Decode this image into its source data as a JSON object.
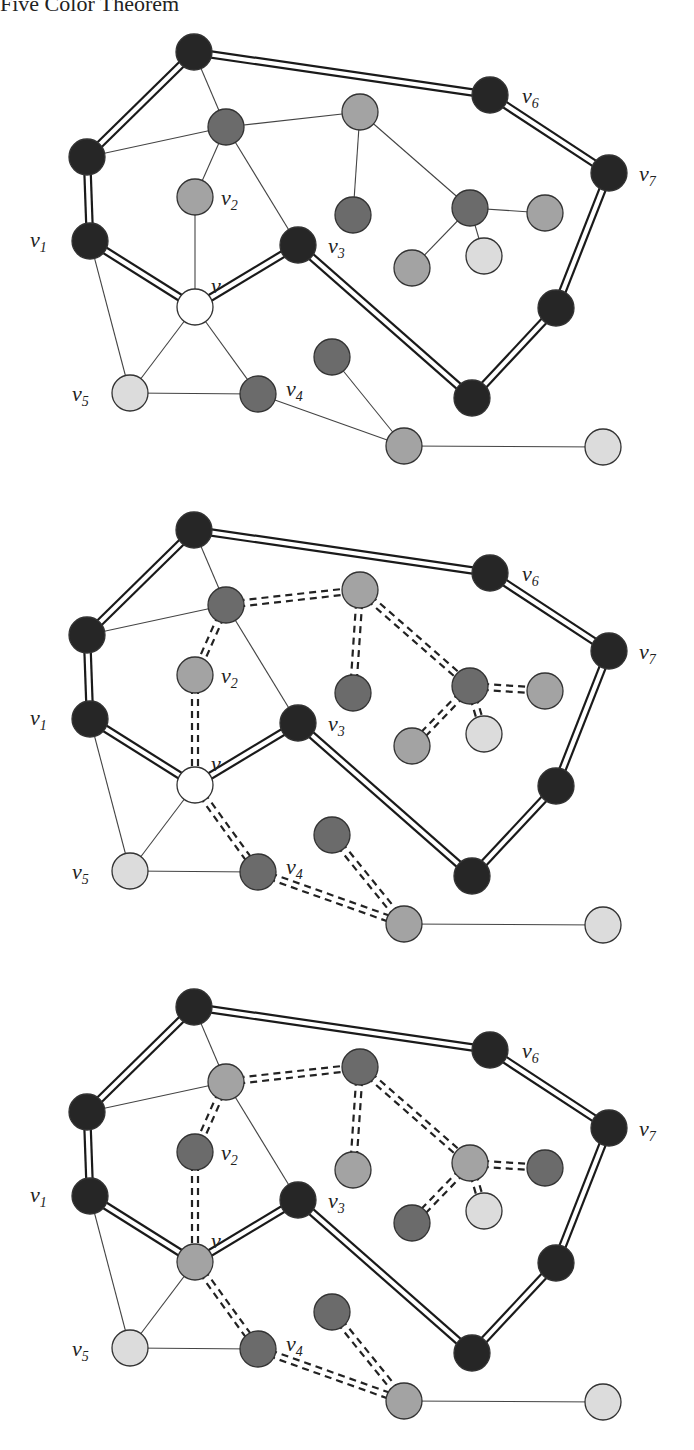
{
  "header": {
    "title": "Five Color Theorem"
  },
  "colors": {
    "black": "#262626",
    "dark": "#6b6b6b",
    "mid": "#a3a3a3",
    "pale": "#dcdcdc",
    "white": "#ffffff",
    "stroke": "#333333"
  },
  "labels": {
    "v": "v",
    "v1": "v1",
    "v2": "v2",
    "v3": "v3",
    "v4": "v4",
    "v5": "v5",
    "v6": "v6",
    "v7": "v7"
  },
  "figures": [
    {
      "id": "figure-1",
      "offset_y": 0,
      "description": "Original coloring; v uncolored (white)",
      "nodes": [
        {
          "id": "a",
          "x": 194,
          "y": 52,
          "fill": "black"
        },
        {
          "id": "v6",
          "x": 490,
          "y": 95,
          "fill": "black",
          "label": "v6"
        },
        {
          "id": "v7",
          "x": 609,
          "y": 173,
          "fill": "black",
          "label": "v7"
        },
        {
          "id": "b",
          "x": 87,
          "y": 157,
          "fill": "black"
        },
        {
          "id": "c",
          "x": 226,
          "y": 127,
          "fill": "dark"
        },
        {
          "id": "d",
          "x": 360,
          "y": 112,
          "fill": "mid"
        },
        {
          "id": "v2",
          "x": 195,
          "y": 197,
          "fill": "mid",
          "label": "v2"
        },
        {
          "id": "e",
          "x": 353,
          "y": 215,
          "fill": "dark"
        },
        {
          "id": "f",
          "x": 470,
          "y": 208,
          "fill": "dark"
        },
        {
          "id": "g",
          "x": 545,
          "y": 213,
          "fill": "mid"
        },
        {
          "id": "h",
          "x": 484,
          "y": 256,
          "fill": "pale"
        },
        {
          "id": "i",
          "x": 412,
          "y": 268,
          "fill": "mid"
        },
        {
          "id": "v1",
          "x": 90,
          "y": 241,
          "fill": "black",
          "label": "v1"
        },
        {
          "id": "v",
          "x": 195,
          "y": 307,
          "fill": "white",
          "label": "v"
        },
        {
          "id": "v3",
          "x": 298,
          "y": 245,
          "fill": "black",
          "label": "v3"
        },
        {
          "id": "j",
          "x": 556,
          "y": 308,
          "fill": "black"
        },
        {
          "id": "k",
          "x": 332,
          "y": 357,
          "fill": "dark"
        },
        {
          "id": "v5",
          "x": 130,
          "y": 393,
          "fill": "pale",
          "label": "v5"
        },
        {
          "id": "v4",
          "x": 258,
          "y": 394,
          "fill": "dark",
          "label": "v4"
        },
        {
          "id": "l",
          "x": 472,
          "y": 398,
          "fill": "black"
        },
        {
          "id": "m",
          "x": 404,
          "y": 446,
          "fill": "mid"
        },
        {
          "id": "n",
          "x": 603,
          "y": 447,
          "fill": "pale"
        }
      ]
    },
    {
      "id": "figure-2",
      "offset_y": 478,
      "description": "Kempe chain (dark/mid) highlighted with dashed double edges",
      "nodes": [
        {
          "id": "a",
          "x": 194,
          "y": 52,
          "fill": "black"
        },
        {
          "id": "v6",
          "x": 490,
          "y": 95,
          "fill": "black",
          "label": "v6"
        },
        {
          "id": "v7",
          "x": 609,
          "y": 173,
          "fill": "black",
          "label": "v7"
        },
        {
          "id": "b",
          "x": 87,
          "y": 157,
          "fill": "black"
        },
        {
          "id": "c",
          "x": 226,
          "y": 127,
          "fill": "dark"
        },
        {
          "id": "d",
          "x": 360,
          "y": 112,
          "fill": "mid"
        },
        {
          "id": "v2",
          "x": 195,
          "y": 197,
          "fill": "mid",
          "label": "v2"
        },
        {
          "id": "e",
          "x": 353,
          "y": 215,
          "fill": "dark"
        },
        {
          "id": "f",
          "x": 470,
          "y": 208,
          "fill": "dark"
        },
        {
          "id": "g",
          "x": 545,
          "y": 213,
          "fill": "mid"
        },
        {
          "id": "h",
          "x": 484,
          "y": 256,
          "fill": "pale"
        },
        {
          "id": "i",
          "x": 412,
          "y": 268,
          "fill": "mid"
        },
        {
          "id": "v1",
          "x": 90,
          "y": 241,
          "fill": "black",
          "label": "v1"
        },
        {
          "id": "v",
          "x": 195,
          "y": 307,
          "fill": "white",
          "label": "v"
        },
        {
          "id": "v3",
          "x": 298,
          "y": 245,
          "fill": "black",
          "label": "v3"
        },
        {
          "id": "j",
          "x": 556,
          "y": 308,
          "fill": "black"
        },
        {
          "id": "k",
          "x": 332,
          "y": 357,
          "fill": "dark"
        },
        {
          "id": "v5",
          "x": 130,
          "y": 393,
          "fill": "pale",
          "label": "v5"
        },
        {
          "id": "v4",
          "x": 258,
          "y": 394,
          "fill": "dark",
          "label": "v4"
        },
        {
          "id": "l",
          "x": 472,
          "y": 398,
          "fill": "black"
        },
        {
          "id": "m",
          "x": 404,
          "y": 446,
          "fill": "mid"
        },
        {
          "id": "n",
          "x": 603,
          "y": 447,
          "fill": "pale"
        }
      ]
    },
    {
      "id": "figure-3",
      "offset_y": 955,
      "description": "Kempe chain colors swapped; v colored mid-gray",
      "nodes": [
        {
          "id": "a",
          "x": 194,
          "y": 52,
          "fill": "black"
        },
        {
          "id": "v6",
          "x": 490,
          "y": 95,
          "fill": "black",
          "label": "v6"
        },
        {
          "id": "v7",
          "x": 609,
          "y": 173,
          "fill": "black",
          "label": "v7"
        },
        {
          "id": "b",
          "x": 87,
          "y": 157,
          "fill": "black"
        },
        {
          "id": "c",
          "x": 226,
          "y": 127,
          "fill": "mid"
        },
        {
          "id": "d",
          "x": 360,
          "y": 112,
          "fill": "dark"
        },
        {
          "id": "v2",
          "x": 195,
          "y": 197,
          "fill": "dark",
          "label": "v2"
        },
        {
          "id": "e",
          "x": 353,
          "y": 215,
          "fill": "mid"
        },
        {
          "id": "f",
          "x": 470,
          "y": 208,
          "fill": "mid"
        },
        {
          "id": "g",
          "x": 545,
          "y": 213,
          "fill": "dark"
        },
        {
          "id": "h",
          "x": 484,
          "y": 256,
          "fill": "pale"
        },
        {
          "id": "i",
          "x": 412,
          "y": 268,
          "fill": "dark"
        },
        {
          "id": "v1",
          "x": 90,
          "y": 241,
          "fill": "black",
          "label": "v1"
        },
        {
          "id": "v",
          "x": 195,
          "y": 307,
          "fill": "mid",
          "label": "v"
        },
        {
          "id": "v3",
          "x": 298,
          "y": 245,
          "fill": "black",
          "label": "v3"
        },
        {
          "id": "j",
          "x": 556,
          "y": 308,
          "fill": "black"
        },
        {
          "id": "k",
          "x": 332,
          "y": 357,
          "fill": "dark"
        },
        {
          "id": "v5",
          "x": 130,
          "y": 393,
          "fill": "pale",
          "label": "v5"
        },
        {
          "id": "v4",
          "x": 258,
          "y": 394,
          "fill": "dark",
          "label": "v4"
        },
        {
          "id": "l",
          "x": 472,
          "y": 398,
          "fill": "black"
        },
        {
          "id": "m",
          "x": 404,
          "y": 446,
          "fill": "mid"
        },
        {
          "id": "n",
          "x": 603,
          "y": 447,
          "fill": "pale"
        }
      ]
    }
  ],
  "edges": {
    "double": [
      [
        "a",
        "b"
      ],
      [
        "a",
        "v6"
      ],
      [
        "v6",
        "v7"
      ],
      [
        "v7",
        "j"
      ],
      [
        "j",
        "l"
      ],
      [
        "l",
        "v3"
      ],
      [
        "v3",
        "v"
      ],
      [
        "v",
        "v1"
      ],
      [
        "v1",
        "b"
      ]
    ],
    "thin": [
      [
        "a",
        "c"
      ],
      [
        "b",
        "c"
      ],
      [
        "c",
        "d"
      ],
      [
        "c",
        "v2"
      ],
      [
        "c",
        "v3"
      ],
      [
        "d",
        "e"
      ],
      [
        "d",
        "f"
      ],
      [
        "f",
        "g"
      ],
      [
        "f",
        "h"
      ],
      [
        "f",
        "i"
      ],
      [
        "v2",
        "v"
      ],
      [
        "v",
        "v5"
      ],
      [
        "v",
        "v4"
      ],
      [
        "v1",
        "v5"
      ],
      [
        "v5",
        "v4"
      ],
      [
        "v4",
        "m"
      ],
      [
        "k",
        "m"
      ],
      [
        "m",
        "n"
      ]
    ],
    "kempe": [
      [
        "c",
        "d"
      ],
      [
        "c",
        "v2"
      ],
      [
        "v2",
        "v"
      ],
      [
        "d",
        "e"
      ],
      [
        "d",
        "f"
      ],
      [
        "f",
        "g"
      ],
      [
        "f",
        "h"
      ],
      [
        "f",
        "i"
      ],
      [
        "v",
        "v4"
      ],
      [
        "v4",
        "m"
      ],
      [
        "k",
        "m"
      ]
    ]
  },
  "label_offsets": {
    "v": [
      16,
      -14
    ],
    "v1": [
      -60,
      6
    ],
    "v2": [
      26,
      8
    ],
    "v3": [
      30,
      8
    ],
    "v4": [
      28,
      2
    ],
    "v5": [
      -58,
      8
    ],
    "v6": [
      32,
      8
    ],
    "v7": [
      30,
      8
    ]
  }
}
